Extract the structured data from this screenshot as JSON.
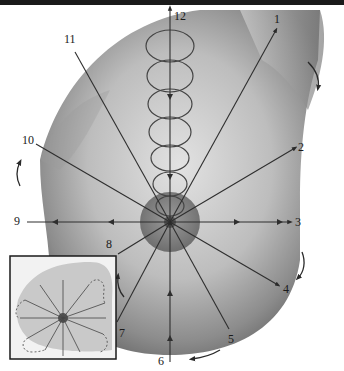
{
  "figure": {
    "center": {
      "x": 170,
      "y": 222
    },
    "clock_labels": [
      {
        "id": "1",
        "text": "1",
        "x": 275,
        "y": 11,
        "end": {
          "x": 276,
          "y": 30
        }
      },
      {
        "id": "2",
        "text": "2",
        "x": 297,
        "y": 141,
        "end": {
          "x": 295,
          "y": 148
        }
      },
      {
        "id": "3",
        "text": "3",
        "x": 295,
        "y": 216,
        "end": {
          "x": 290,
          "y": 222
        }
      },
      {
        "id": "4",
        "text": "4",
        "x": 282,
        "y": 283,
        "end": {
          "x": 278,
          "y": 285
        }
      },
      {
        "id": "5",
        "text": "5",
        "x": 228,
        "y": 333,
        "end": {
          "x": 229,
          "y": 329
        }
      },
      {
        "id": "6",
        "text": "6",
        "x": 159,
        "y": 355,
        "end": {
          "x": 170,
          "y": 362
        }
      },
      {
        "id": "7",
        "text": "7",
        "x": 118,
        "y": 328,
        "end": {
          "x": 117,
          "y": 322
        }
      },
      {
        "id": "8",
        "text": "8",
        "x": 106,
        "y": 238,
        "end": {
          "x": 118,
          "y": 254
        }
      },
      {
        "id": "9",
        "text": "9",
        "x": 15,
        "y": 216,
        "end": {
          "x": 27,
          "y": 222
        }
      },
      {
        "id": "10",
        "text": "10",
        "x": 23,
        "y": 135,
        "end": {
          "x": 36,
          "y": 144
        }
      },
      {
        "id": "11",
        "text": "11",
        "x": 65,
        "y": 33,
        "end": {
          "x": 75,
          "y": 52
        }
      },
      {
        "id": "12",
        "text": "12",
        "x": 173,
        "y": 11,
        "end": {
          "x": 170,
          "y": 10
        }
      }
    ],
    "spiral_loops": {
      "count": 7,
      "axis_x": 170,
      "top_y": 32,
      "bottom_y": 210,
      "rx": 23,
      "ry": 16
    },
    "rotation_arrows": [
      {
        "name": "right-top",
        "direction": "clockwise-down"
      },
      {
        "name": "left-mid",
        "direction": "up"
      },
      {
        "name": "right-lower",
        "direction": "down"
      },
      {
        "name": "bottom",
        "direction": "left"
      },
      {
        "name": "inset-edge",
        "direction": "up"
      }
    ],
    "inset": {
      "x": 10,
      "y": 256,
      "width": 106,
      "height": 103,
      "description": "small overview with dashed petal outlines"
    }
  }
}
